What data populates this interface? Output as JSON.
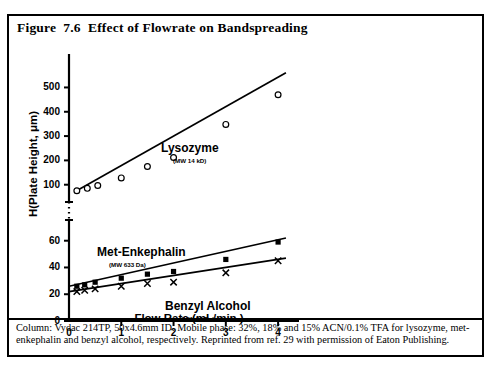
{
  "figure": {
    "title": "Figure  7.6  Effect of Flowrate on Bandspreading",
    "caption": "Column: Vydac 214TP, 50x4.6mm ID. Mobile phase: 32%, 18% and 15% ACN/0.1% TFA for lysozyme, met-enkephalin and benzyl alcohol, respectively. Reprinted from ref. 29 with permission of Eaton Publishing.",
    "border_color": "#000000",
    "background_color": "#ffffff"
  },
  "chart_data": {
    "type": "scatter",
    "title": "Effect of Flowrate on Bandspreading",
    "xlabel": "Flow Rate (mL/min.)",
    "ylabel": "H(Plate Height, μm)",
    "xlim": [
      0,
      4.4
    ],
    "xticks": [
      0,
      1,
      2,
      3,
      4
    ],
    "xtick_labels": [
      "0",
      "1",
      "2",
      "3",
      "4"
    ],
    "grid": false,
    "legend": "inline-annotations",
    "broken_axis": true,
    "y_axis_lower": {
      "ylim": [
        0,
        68
      ],
      "yticks": [
        0,
        20,
        40,
        60
      ],
      "ytick_labels": [
        "0",
        "20",
        "40",
        "60"
      ]
    },
    "y_axis_upper": {
      "ylim": [
        70,
        580
      ],
      "yticks": [
        100,
        200,
        300,
        400,
        500
      ],
      "ytick_labels": [
        "100",
        "200",
        "300",
        "400",
        "500"
      ]
    },
    "series": [
      {
        "name": "Lysozyme",
        "sublabel": "(MW 14 kD)",
        "marker": "open-circle",
        "panel": "upper",
        "x": [
          0.15,
          0.35,
          0.55,
          1.0,
          1.5,
          2.0,
          3.0,
          4.0
        ],
        "values": [
          75,
          85,
          97,
          128,
          175,
          212,
          348,
          470
        ],
        "fit_line": {
          "x": [
            0.12,
            4.15
          ],
          "y": [
            72,
            560
          ]
        }
      },
      {
        "name": "Met-Enkephalin",
        "sublabel": "(MW 633 Da)",
        "marker": "filled-square",
        "panel": "lower",
        "x": [
          0.15,
          0.3,
          0.5,
          1.0,
          1.5,
          2.0,
          3.0,
          4.0
        ],
        "values": [
          26,
          27,
          29,
          32,
          35,
          37,
          46,
          59
        ],
        "fit_line": {
          "x": [
            0.0,
            4.15
          ],
          "y": [
            26,
            62
          ]
        }
      },
      {
        "name": "Benzyl Alcohol",
        "sublabel": "(MW 94 Da)",
        "marker": "x-cross",
        "panel": "lower",
        "x": [
          0.15,
          0.3,
          0.5,
          1.0,
          1.5,
          2.0,
          3.0,
          4.0
        ],
        "values": [
          22,
          23,
          24,
          26,
          28,
          29,
          36,
          45
        ],
        "fit_line": {
          "x": [
            0.0,
            4.15
          ],
          "y": [
            22,
            47
          ]
        }
      }
    ]
  }
}
